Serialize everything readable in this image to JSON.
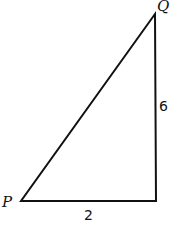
{
  "diagram": {
    "type": "right-triangle",
    "vertices": {
      "P": {
        "label": "P",
        "x": 21,
        "y": 201
      },
      "R": {
        "label": "",
        "x": 156,
        "y": 201
      },
      "Q": {
        "label": "Q",
        "x": 155,
        "y": 14
      }
    },
    "sides": {
      "vertical": {
        "label": "6"
      },
      "horizontal": {
        "label": "2"
      }
    },
    "stroke_color": "#111111",
    "background": "#ffffff"
  }
}
